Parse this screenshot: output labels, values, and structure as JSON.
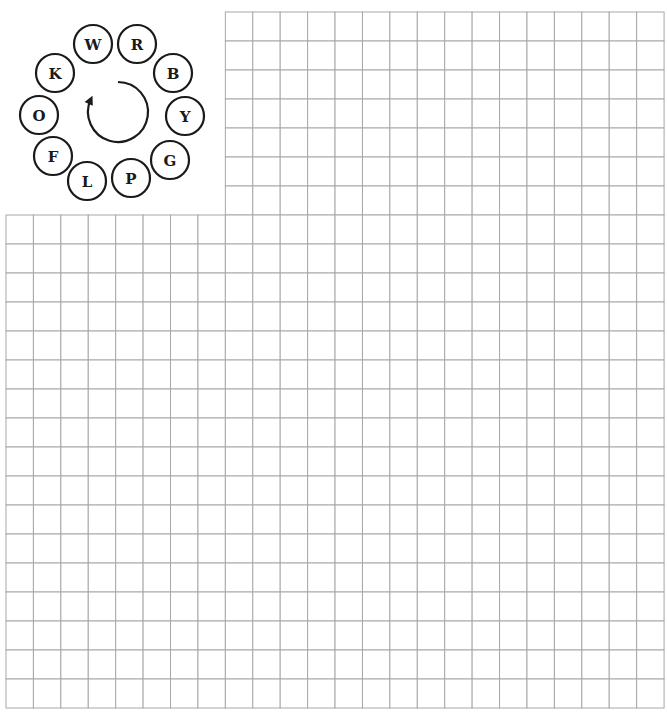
{
  "puzzle": {
    "legend": {
      "letters": [
        {
          "letter": "W",
          "cx": 93,
          "cy": 44
        },
        {
          "letter": "R",
          "cx": 137,
          "cy": 44
        },
        {
          "letter": "B",
          "cx": 173,
          "cy": 73
        },
        {
          "letter": "Y",
          "cx": 185,
          "cy": 116
        },
        {
          "letter": "G",
          "cx": 170,
          "cy": 160
        },
        {
          "letter": "P",
          "cx": 131,
          "cy": 178
        },
        {
          "letter": "L",
          "cx": 87,
          "cy": 181
        },
        {
          "letter": "F",
          "cx": 53,
          "cy": 156
        },
        {
          "letter": "O",
          "cx": 39,
          "cy": 115
        },
        {
          "letter": "K",
          "cx": 55,
          "cy": 73
        }
      ],
      "circle_radius": 19,
      "rotation_direction": "clockwise",
      "arrow": {
        "cx": 118,
        "cy": 112,
        "r": 30,
        "start_deg": -90,
        "end_deg": 205
      }
    },
    "grid": {
      "origin_x": 6,
      "origin_y": 12,
      "cols": 24,
      "rows": 24,
      "cell_w": 27.42,
      "cell_h": 29.0,
      "cutout": {
        "cols": 8,
        "rows": 7
      },
      "line_color": "#a8a8a8"
    }
  }
}
